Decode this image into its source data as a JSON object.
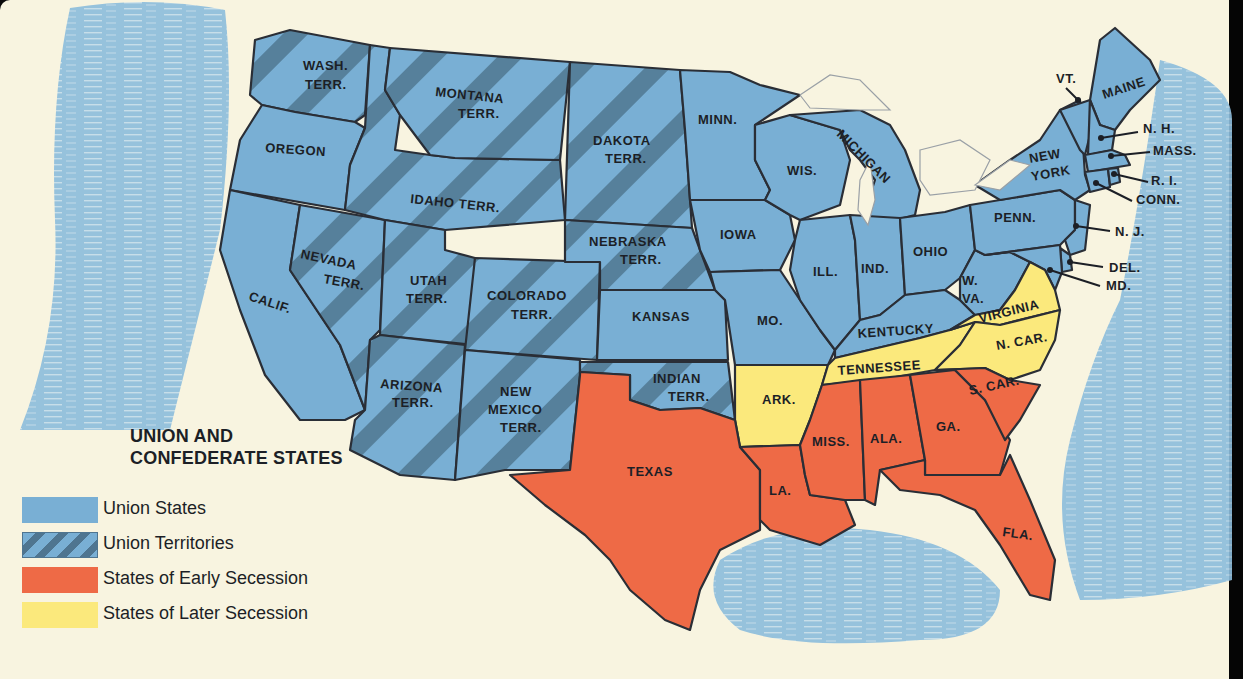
{
  "title": {
    "line1": "UNION AND",
    "line2": "CONFEDERATE STATES"
  },
  "legend": [
    {
      "label": "Union States",
      "key": "union-states",
      "color": "#79afd4"
    },
    {
      "label": "Union Territories",
      "key": "union-territories",
      "color": "#79afd4",
      "stripe_color": "#4f7590"
    },
    {
      "label": "States of Early Secession",
      "key": "early-secession",
      "color": "#ee6a46"
    },
    {
      "label": "States of Later Secession",
      "key": "later-secession",
      "color": "#fbe97c"
    }
  ],
  "colors": {
    "paper": "#f8f4e0",
    "water": "#8bbcdc",
    "union": "#79afd4",
    "territory_stripe": "#4f7590",
    "early": "#ee6a46",
    "later": "#fbe97c",
    "border": "#2a2e36",
    "text": "#1c1f26"
  },
  "regions": {
    "wash_terr": {
      "name": "WASH.",
      "name2": "TERR.",
      "status": "Union Territory"
    },
    "oregon": {
      "name": "OREGON",
      "status": "Union State"
    },
    "calif": {
      "name": "CALIF.",
      "status": "Union State"
    },
    "nevada_terr": {
      "name": "NEVADA",
      "name2": "TERR.",
      "status": "Union Territory"
    },
    "idaho_terr": {
      "name": "IDAHO TERR.",
      "status": "Union Territory"
    },
    "montana_terr": {
      "name": "MONTANA",
      "name2": "TERR.",
      "status": "Union Territory"
    },
    "utah_terr": {
      "name": "UTAH",
      "name2": "TERR.",
      "status": "Union Territory"
    },
    "arizona_terr": {
      "name": "ARIZONA",
      "name2": "TERR.",
      "status": "Union Territory"
    },
    "colorado_terr": {
      "name": "COLORADO",
      "name2": "TERR.",
      "status": "Union Territory"
    },
    "new_mexico_terr": {
      "name": "NEW",
      "name2": "MEXICO",
      "name3": "TERR.",
      "status": "Union Territory"
    },
    "dakota_terr": {
      "name": "DAKOTA",
      "name2": "TERR.",
      "status": "Union Territory"
    },
    "nebraska_terr": {
      "name": "NEBRASKA",
      "name2": "TERR.",
      "status": "Union Territory"
    },
    "kansas": {
      "name": "KANSAS",
      "status": "Union State"
    },
    "indian_terr": {
      "name": "INDIAN",
      "name2": "TERR.",
      "status": "Union Territory"
    },
    "texas": {
      "name": "TEXAS",
      "status": "Early Secession"
    },
    "minn": {
      "name": "MINN.",
      "status": "Union State"
    },
    "iowa": {
      "name": "IOWA",
      "status": "Union State"
    },
    "mo": {
      "name": "MO.",
      "status": "Union State"
    },
    "ark": {
      "name": "ARK.",
      "status": "Later Secession"
    },
    "la": {
      "name": "LA.",
      "status": "Early Secession"
    },
    "wis": {
      "name": "WIS.",
      "status": "Union State"
    },
    "michigan": {
      "name": "MICHIGAN",
      "status": "Union State"
    },
    "ill": {
      "name": "ILL.",
      "status": "Union State"
    },
    "ind": {
      "name": "IND.",
      "status": "Union State"
    },
    "ohio": {
      "name": "OHIO",
      "status": "Union State"
    },
    "kentucky": {
      "name": "KENTUCKY",
      "status": "Union State"
    },
    "tennessee": {
      "name": "TENNESSEE",
      "status": "Later Secession"
    },
    "miss": {
      "name": "MISS.",
      "status": "Early Secession"
    },
    "ala": {
      "name": "ALA.",
      "status": "Early Secession"
    },
    "ga": {
      "name": "GA.",
      "status": "Early Secession"
    },
    "fla": {
      "name": "FLA.",
      "status": "Early Secession"
    },
    "s_car": {
      "name": "S. CAR.",
      "status": "Early Secession"
    },
    "n_car": {
      "name": "N. CAR.",
      "status": "Later Secession"
    },
    "virginia": {
      "name": "VIRGINIA",
      "status": "Later Secession"
    },
    "w_va": {
      "name": "W.",
      "name2": "VA.",
      "status": "Union State"
    },
    "penn": {
      "name": "PENN.",
      "status": "Union State"
    },
    "new_york": {
      "name": "NEW",
      "name2": "YORK",
      "status": "Union State"
    },
    "vt": {
      "name": "VT.",
      "status": "Union State"
    },
    "maine": {
      "name": "MAINE",
      "status": "Union State"
    },
    "nh": {
      "name": "N. H.",
      "status": "Union State"
    },
    "mass": {
      "name": "MASS.",
      "status": "Union State"
    },
    "ri": {
      "name": "R. I.",
      "status": "Union State"
    },
    "conn": {
      "name": "CONN.",
      "status": "Union State"
    },
    "nj": {
      "name": "N. J.",
      "status": "Union State"
    },
    "del": {
      "name": "DEL.",
      "status": "Union State"
    },
    "md": {
      "name": "MD.",
      "status": "Union State"
    }
  }
}
